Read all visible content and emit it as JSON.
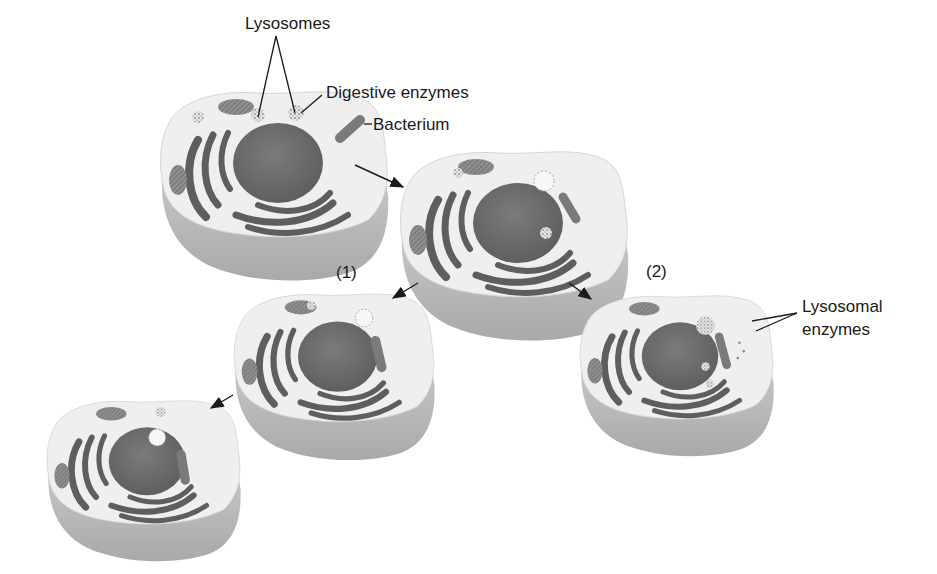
{
  "diagram": {
    "labels": {
      "lysosomes": "Lysosomes",
      "digestive_enzymes": "Digestive enzymes",
      "bacterium": "Bacterium",
      "pathway_1": "(1)",
      "pathway_2": "(2)",
      "lysosomal_enzymes_line1": "Lysosomal",
      "lysosomal_enzymes_line2": "enzymes"
    },
    "cells": [
      {
        "id": "cell-initial",
        "stage": "Cell with lysosomes; bacterium outside"
      },
      {
        "id": "cell-engulfing",
        "stage": "Bacterium being engulfed"
      },
      {
        "id": "cell-pathway-1a",
        "stage": "Pathway (1): lysosome fuses with vesicle"
      },
      {
        "id": "cell-pathway-1b",
        "stage": "Pathway (1): digestion continues"
      },
      {
        "id": "cell-pathway-2",
        "stage": "Pathway (2): lysosomal enzymes released"
      }
    ],
    "colors": {
      "cytoplasm": "#efefef",
      "cell_side": "#bdbdbd",
      "nucleus": "#6b6b6b",
      "er": "#5e5e5e",
      "bacterium": "#7a7a7a",
      "text": "#1a1a1a",
      "arrow": "#1a1a1a"
    }
  }
}
